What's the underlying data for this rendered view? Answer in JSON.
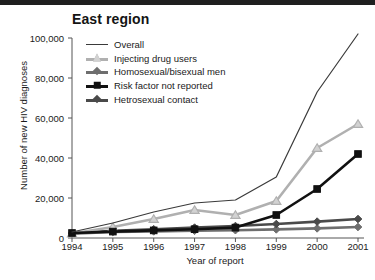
{
  "chart_data": {
    "type": "line",
    "title": "East region",
    "xlabel": "Year of report",
    "ylabel": "Number of new HIV diagnoses",
    "x": [
      1994,
      1995,
      1996,
      1997,
      1998,
      1999,
      2000,
      2001
    ],
    "xtick_labels": [
      "1994",
      "1995",
      "1996",
      "1997",
      "1998",
      "1999",
      "2000",
      "2001"
    ],
    "ytick_labels": [
      "0",
      "20,000",
      "40,000",
      "60,000",
      "80,000",
      "100,000"
    ],
    "ytick_values": [
      0,
      20000,
      40000,
      60000,
      80000,
      100000
    ],
    "ylim": [
      0,
      100000
    ],
    "xlim": [
      1994,
      2001
    ],
    "grid": false,
    "legend_position": "top-left inside axes",
    "series": [
      {
        "name": "Overall",
        "marker": "none",
        "color": "#3a3a3a",
        "values": [
          3000,
          7500,
          13000,
          17500,
          19000,
          30500,
          73000,
          102000
        ]
      },
      {
        "name": "Injecting drug users",
        "marker": "triangle",
        "color": "#b0b0b0",
        "values": [
          2200,
          5500,
          9500,
          14000,
          11500,
          18500,
          45000,
          57000
        ]
      },
      {
        "name": "Homosexual/bisexual men",
        "marker": "diamond",
        "color": "#6e6e6e",
        "values": [
          2200,
          3000,
          3300,
          3600,
          3900,
          4300,
          4800,
          5500
        ]
      },
      {
        "name": "Risk factor not reported",
        "marker": "square",
        "color": "#111111",
        "values": [
          2500,
          3200,
          3800,
          4400,
          5200,
          11500,
          24500,
          42000
        ]
      },
      {
        "name": "Hetrosexual contact",
        "marker": "diamond",
        "color": "#4a4a4a",
        "values": [
          2400,
          3600,
          4400,
          5200,
          6000,
          7000,
          8200,
          9500
        ]
      }
    ]
  }
}
